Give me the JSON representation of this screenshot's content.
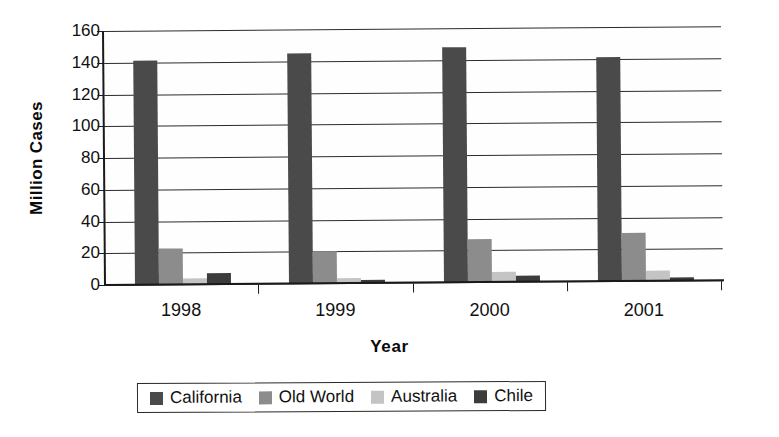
{
  "chart_data": {
    "type": "bar",
    "title": "",
    "xlabel": "Year",
    "ylabel": "Million Cases",
    "categories": [
      "1998",
      "1999",
      "2000",
      "2001"
    ],
    "ylim": [
      0,
      160
    ],
    "yticks": [
      0,
      20,
      40,
      60,
      80,
      100,
      120,
      140,
      160
    ],
    "grid": true,
    "legend_position": "bottom",
    "series": [
      {
        "name": "California",
        "color": "#4a4a4a",
        "values": [
          141,
          145,
          148,
          141
        ]
      },
      {
        "name": "Old World",
        "color": "#8c8c8c",
        "values": [
          23,
          20,
          27,
          30
        ]
      },
      {
        "name": "Australia",
        "color": "#c4c4c4",
        "values": [
          4,
          3,
          6,
          6
        ]
      },
      {
        "name": "Chile",
        "color": "#3c3c3c",
        "values": [
          7,
          2,
          4,
          2
        ]
      }
    ]
  },
  "axes": {
    "y_title": "Million Cases",
    "x_title": "Year",
    "y_tick_labels": [
      "160",
      "140",
      "120",
      "100",
      "80",
      "60",
      "40",
      "20",
      "0"
    ],
    "x_tick_labels": [
      "1998",
      "1999",
      "2000",
      "2001"
    ]
  },
  "legend": {
    "entries": [
      {
        "label": "California",
        "color": "#4a4a4a"
      },
      {
        "label": "Old World",
        "color": "#8c8c8c"
      },
      {
        "label": "Australia",
        "color": "#c4c4c4"
      },
      {
        "label": "Chile",
        "color": "#3c3c3c"
      }
    ]
  },
  "footer": {
    "caption": ""
  }
}
